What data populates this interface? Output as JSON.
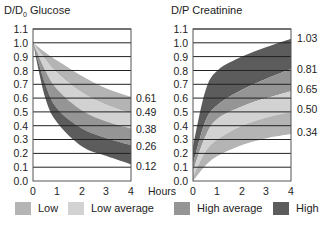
{
  "chart_data": [
    {
      "type": "area",
      "title": "D/D0 Glucose",
      "xlabel": "Hours",
      "ylabel": "D/D0 Glucose",
      "xlim": [
        0,
        4
      ],
      "ylim": [
        0,
        1.1
      ],
      "x_ticks": [
        "0",
        "1",
        "2",
        "3",
        "4"
      ],
      "y_ticks": [
        "0.0",
        "0.1",
        "0.2",
        "0.3",
        "0.4",
        "0.5",
        "0.6",
        "0.7",
        "0.8",
        "0.9",
        "1.0",
        "1.1"
      ],
      "grid": "horizontal",
      "x": [
        0,
        0.5,
        1,
        2,
        3,
        4
      ],
      "boundaries": [
        {
          "name": "0.61",
          "values": [
            1.0,
            0.93,
            0.87,
            0.76,
            0.67,
            0.61
          ]
        },
        {
          "name": "0.49",
          "values": [
            1.0,
            0.88,
            0.78,
            0.64,
            0.55,
            0.49
          ]
        },
        {
          "name": "0.38",
          "values": [
            1.0,
            0.8,
            0.66,
            0.51,
            0.43,
            0.38
          ]
        },
        {
          "name": "0.26",
          "values": [
            1.0,
            0.7,
            0.52,
            0.38,
            0.31,
            0.26
          ]
        },
        {
          "name": "0.12",
          "values": [
            1.0,
            0.6,
            0.42,
            0.25,
            0.18,
            0.12
          ]
        }
      ],
      "series": [
        {
          "name": "Low",
          "range_at_4h": [
            0.49,
            0.61
          ]
        },
        {
          "name": "Low average",
          "range_at_4h": [
            0.38,
            0.49
          ]
        },
        {
          "name": "High average",
          "range_at_4h": [
            0.26,
            0.38
          ]
        },
        {
          "name": "High",
          "range_at_4h": [
            0.12,
            0.26
          ]
        }
      ],
      "end_labels": [
        "0.61",
        "0.49",
        "0.38",
        "0.26",
        "0.12"
      ]
    },
    {
      "type": "area",
      "title": "D/P Creatinine",
      "xlabel": "Hours",
      "ylabel": "D/P Creatinine",
      "xlim": [
        0,
        4
      ],
      "ylim": [
        0,
        1.1
      ],
      "x_ticks": [
        "0",
        "1",
        "2",
        "3",
        "4"
      ],
      "y_ticks": [
        "0.0",
        "0.1",
        "0.2",
        "0.3",
        "0.4",
        "0.5",
        "0.6",
        "0.7",
        "0.8",
        "0.9",
        "1.0",
        "1.1"
      ],
      "grid": "horizontal",
      "x": [
        0,
        0.5,
        1,
        2,
        3,
        4
      ],
      "boundaries": [
        {
          "name": "1.03",
          "values": [
            0.25,
            0.65,
            0.8,
            0.9,
            0.97,
            1.03
          ]
        },
        {
          "name": "0.81",
          "values": [
            0.12,
            0.43,
            0.55,
            0.66,
            0.74,
            0.81
          ]
        },
        {
          "name": "0.65",
          "values": [
            0.07,
            0.32,
            0.45,
            0.54,
            0.6,
            0.65
          ]
        },
        {
          "name": "0.50",
          "values": [
            0.03,
            0.21,
            0.3,
            0.4,
            0.46,
            0.5
          ]
        },
        {
          "name": "0.34",
          "values": [
            0.0,
            0.11,
            0.18,
            0.26,
            0.31,
            0.34
          ]
        }
      ],
      "series": [
        {
          "name": "High",
          "range_at_4h": [
            0.81,
            1.03
          ]
        },
        {
          "name": "High average",
          "range_at_4h": [
            0.65,
            0.81
          ]
        },
        {
          "name": "Low average",
          "range_at_4h": [
            0.5,
            0.65
          ]
        },
        {
          "name": "Low",
          "range_at_4h": [
            0.34,
            0.5
          ]
        }
      ],
      "end_labels": [
        "1.03",
        "0.81",
        "0.65",
        "0.50",
        "0.34"
      ]
    }
  ],
  "glucose": {
    "title_main": "D/D",
    "title_sub": "0",
    "title_rest": " Glucose",
    "end_labels": [
      "0.61",
      "0.49",
      "0.38",
      "0.26",
      "0.12"
    ]
  },
  "creatinine": {
    "title": "D/P Creatinine",
    "end_labels": [
      "1.03",
      "0.81",
      "0.65",
      "0.50",
      "0.34"
    ]
  },
  "axis": {
    "y_ticks": [
      "1.1",
      "1.0",
      "0.9",
      "0.8",
      "0.7",
      "0.6",
      "0.5",
      "0.4",
      "0.3",
      "0.2",
      "0.1",
      "0.0"
    ],
    "x_ticks": [
      "0",
      "1",
      "2",
      "3",
      "4"
    ],
    "x_label": "Hours"
  },
  "legend": {
    "items": [
      {
        "label": "Low",
        "color": "#b4b4b4"
      },
      {
        "label": "Low average",
        "color": "#d2d2d2"
      },
      {
        "label": "High average",
        "color": "#959595"
      },
      {
        "label": "High",
        "color": "#5c5c5c"
      }
    ]
  }
}
